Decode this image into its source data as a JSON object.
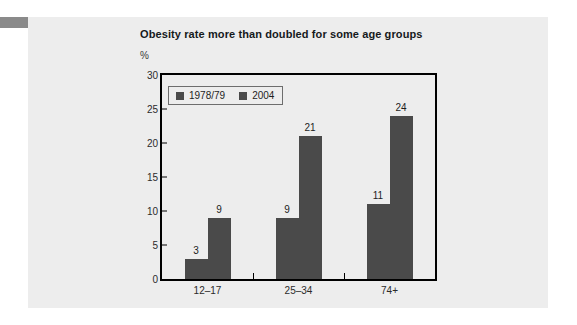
{
  "page": {
    "background_color": "#ffffff",
    "marker_color": "#8a8a8a",
    "panel_color": "#ededed"
  },
  "chart_data": {
    "type": "bar",
    "title": "Obesity rate more than doubled for some age groups",
    "subtitle": "",
    "xlabel": "",
    "ylabel": "%",
    "categories": [
      "12–17",
      "25–34",
      "74+"
    ],
    "series": [
      {
        "name": "1978/79",
        "values": [
          3,
          9,
          11
        ],
        "color": "#4a4a4a"
      },
      {
        "name": "2004",
        "values": [
          9,
          21,
          24
        ],
        "color": "#4a4a4a"
      }
    ],
    "ylim": [
      0,
      30
    ],
    "yticks": [
      0,
      5,
      10,
      15,
      20,
      25,
      30
    ],
    "ytick_labels": [
      "0",
      "5",
      "10",
      "15",
      "20",
      "25",
      "30"
    ],
    "grid": false,
    "legend_position": "top-left-inside",
    "data_labels": true,
    "axis_color": "#000000",
    "text_color": "#1d1d1d"
  }
}
